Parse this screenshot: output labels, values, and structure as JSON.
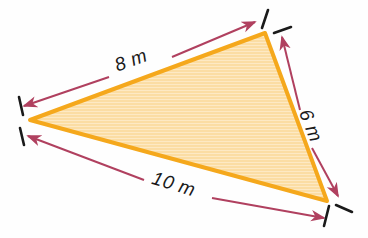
{
  "figure": {
    "name": "scalene-triangle-with-dimensions",
    "background_color": "#fefefe",
    "shape": {
      "name": "triangle",
      "fill_color": "#fad79a",
      "fill_color_light": "#fde8c0",
      "stroke_color": "#f5a81c",
      "stroke_width": 4,
      "vertices": [
        {
          "name": "top-right-vertex",
          "x": 265,
          "y": 33
        },
        {
          "name": "left-vertex",
          "x": 30,
          "y": 120
        },
        {
          "name": "bottom-right-vertex",
          "x": 327,
          "y": 201
        }
      ]
    },
    "dimension_color": "#b0405f",
    "tick_color": "#1a1a1a",
    "dimensions": [
      {
        "id": "side-8m",
        "label": "8 m",
        "value": 8,
        "unit": "m",
        "side": "top-left",
        "label_rotation": -20,
        "label_x": 133,
        "label_y": 66
      },
      {
        "id": "side-6m",
        "label": "6 m",
        "value": 6,
        "unit": "m",
        "side": "right",
        "label_rotation": 68,
        "label_x": 305,
        "label_y": 128
      },
      {
        "id": "side-10m",
        "label": "10 m",
        "value": 10,
        "unit": "m",
        "side": "bottom",
        "label_rotation": 17,
        "label_x": 172,
        "label_y": 190
      }
    ]
  }
}
